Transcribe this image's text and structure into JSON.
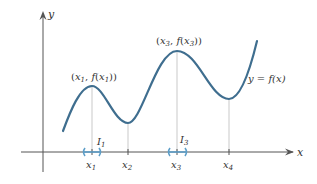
{
  "figure": {
    "axes": {
      "x_label": "x",
      "y_label": "y"
    },
    "curve": {
      "label": "y = f(x)",
      "color": "#3f6e8f"
    },
    "points": [
      {
        "label": "(x",
        "sub": "1",
        "mid": ", f(x",
        "sub2": "1",
        "end": "))"
      },
      {
        "label": "(x",
        "sub": "3",
        "mid": ", f(x",
        "sub2": "3",
        "end": "))"
      }
    ],
    "ticks": [
      {
        "name": "x",
        "sub": "1"
      },
      {
        "name": "x",
        "sub": "2"
      },
      {
        "name": "x",
        "sub": "3"
      },
      {
        "name": "x",
        "sub": "4"
      }
    ],
    "intervals": [
      {
        "name": "I",
        "sub": "1",
        "color": "#7fb3d5"
      },
      {
        "name": "I",
        "sub": "3",
        "color": "#7fb3d5"
      }
    ],
    "guide_line_color": "#bbbbbb",
    "axis_color": "#555555"
  }
}
